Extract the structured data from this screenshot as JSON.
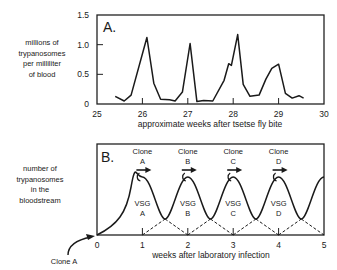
{
  "chart_data": [
    {
      "type": "line",
      "panel_label": "A.",
      "title": "",
      "xlabel": "approximate weeks after tsetse fly bite",
      "ylabel": "millions of trypanosomes per milliliter of blood",
      "ylabel_lines": [
        "millions of",
        "trypanosomes",
        "per milliliter",
        "of blood"
      ],
      "xlim": [
        25,
        30
      ],
      "ylim": [
        0,
        1.5
      ],
      "x_ticks": [
        "25",
        "26",
        "27",
        "28",
        "29",
        "30"
      ],
      "y_ticks": [
        "0",
        "0.5",
        "1.0",
        "1.5"
      ],
      "grid": false,
      "series": [
        {
          "name": "parasitemia",
          "x": [
            25.4,
            25.6,
            25.75,
            26.1,
            26.25,
            26.4,
            26.6,
            26.72,
            26.88,
            27.05,
            27.2,
            27.35,
            27.55,
            27.8,
            27.9,
            27.96,
            28.1,
            28.22,
            28.37,
            28.57,
            28.72,
            28.85,
            29.0,
            29.15,
            29.3,
            29.45,
            29.55
          ],
          "y": [
            0.13,
            0.05,
            0.15,
            1.12,
            0.35,
            0.08,
            0.07,
            0.05,
            0.2,
            1.02,
            0.04,
            0.06,
            0.05,
            0.4,
            0.68,
            0.65,
            1.17,
            0.33,
            0.13,
            0.15,
            0.42,
            0.6,
            0.67,
            0.18,
            0.1,
            0.14,
            0.1
          ]
        }
      ]
    },
    {
      "type": "line",
      "panel_label": "B.",
      "title": "",
      "xlabel": "weeks after laboratory infection",
      "ylabel": "number of trypanosomes in the bloodstream",
      "ylabel_lines": [
        "number of",
        "trypanosomes",
        "in the",
        "bloodstream"
      ],
      "xlim": [
        0,
        5
      ],
      "x_ticks": [
        "0",
        "1",
        "2",
        "3",
        "4",
        "5"
      ],
      "grid": false,
      "schematic": true,
      "peaks_at_weeks": [
        1,
        2,
        3,
        4,
        5
      ],
      "clone_labels": [
        {
          "top": "Clone",
          "letter": "A",
          "x": 1
        },
        {
          "top": "Clone",
          "letter": "B",
          "x": 2
        },
        {
          "top": "Clone",
          "letter": "C",
          "x": 3
        },
        {
          "top": "Clone",
          "letter": "D",
          "x": 4
        }
      ],
      "vsg_labels": [
        {
          "top": "VSG",
          "letter": "A",
          "x": 1
        },
        {
          "top": "VSG",
          "letter": "B",
          "x": 2
        },
        {
          "top": "VSG",
          "letter": "C",
          "x": 3
        },
        {
          "top": "VSG",
          "letter": "D",
          "x": 4
        }
      ],
      "annotation": "Clone A",
      "series": [
        {
          "name": "total population (solid)",
          "style": "solid"
        },
        {
          "name": "individual clone populations (dashed)",
          "style": "dashed"
        }
      ]
    }
  ]
}
